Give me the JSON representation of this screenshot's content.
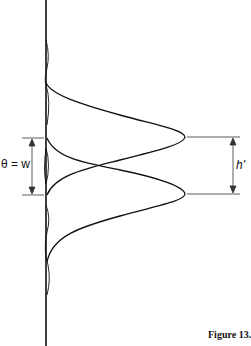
{
  "diagram": {
    "left_label": "θ = w",
    "right_label": "h'",
    "caption": "Figure 13.13 In",
    "stroke_color": "#111111",
    "dimension_color": "#333333"
  }
}
